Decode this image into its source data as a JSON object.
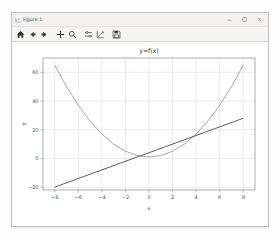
{
  "window": {
    "title": "Figure 1",
    "app_icon": "figure-icon",
    "controls": [
      {
        "name": "minimize-button",
        "glyph": "minimize-icon"
      },
      {
        "name": "maximize-button",
        "glyph": "maximize-icon"
      },
      {
        "name": "close-button",
        "glyph": "close-icon"
      }
    ]
  },
  "toolbar": {
    "buttons": [
      {
        "name": "home-button",
        "icon": "home-icon",
        "tooltip": "Reset original view"
      },
      {
        "name": "back-button",
        "icon": "arrow-left-icon",
        "tooltip": "Back to previous view"
      },
      {
        "name": "forward-button",
        "icon": "arrow-right-icon",
        "tooltip": "Forward to next view"
      },
      {
        "name": "pan-button",
        "icon": "move-cross-icon",
        "tooltip": "Pan axes with left mouse, zoom with right"
      },
      {
        "name": "zoom-button",
        "icon": "magnifier-icon",
        "tooltip": "Zoom to rectangle"
      },
      {
        "name": "subplots-button",
        "icon": "sliders-icon",
        "tooltip": "Configure subplots"
      },
      {
        "name": "customize-button",
        "icon": "axis-edit-icon",
        "tooltip": "Edit axis, curve and image parameters"
      },
      {
        "name": "save-button",
        "icon": "floppy-disk-icon",
        "tooltip": "Save the figure"
      }
    ]
  },
  "chart_data": {
    "type": "line",
    "title": "y=f(x)",
    "xlabel": "x",
    "ylabel": "y",
    "grid": true,
    "legend": null,
    "xlim": [
      -9,
      9
    ],
    "ylim": [
      -22,
      70
    ],
    "xticks": [
      -8,
      -6,
      -4,
      -2,
      0,
      2,
      4,
      6,
      8
    ],
    "xticklabels": [
      "−8",
      "−6",
      "−4",
      "−2",
      "0",
      "2",
      "4",
      "6",
      "8"
    ],
    "yticks": [
      -20,
      0,
      20,
      40,
      60
    ],
    "yticklabels": [
      "−20",
      "0",
      "20",
      "40",
      "60"
    ],
    "series": [
      {
        "name": "parabola",
        "color": "#8f8f8f",
        "x": [
          -8,
          -7,
          -6,
          -5,
          -4,
          -3,
          -2,
          -1,
          0,
          1,
          2,
          3,
          4,
          5,
          6,
          7,
          8
        ],
        "values": [
          65,
          50,
          37,
          26,
          17,
          10,
          5,
          2,
          1,
          2,
          5,
          10,
          17,
          26,
          37,
          50,
          65
        ]
      },
      {
        "name": "straight-line",
        "color": "#4a4a4a",
        "x": [
          -8,
          8
        ],
        "values": [
          -20,
          28
        ]
      }
    ]
  }
}
